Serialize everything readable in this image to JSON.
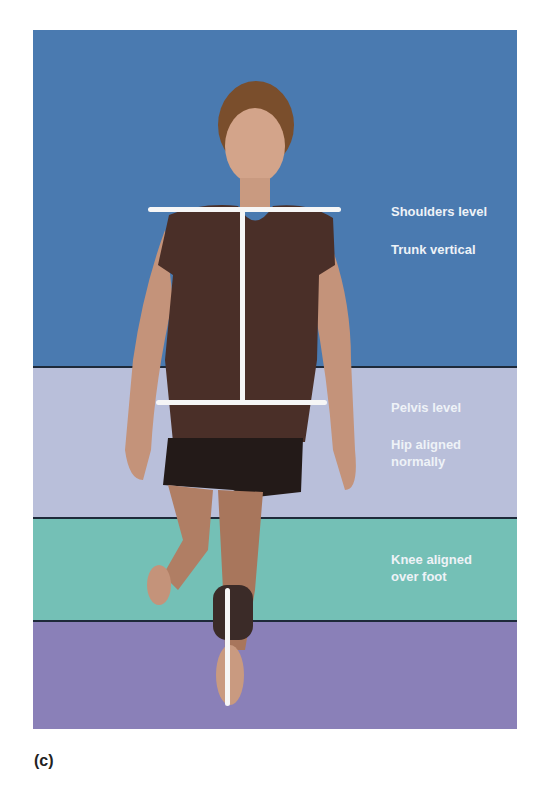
{
  "figure": {
    "bands": [
      {
        "name": "upper",
        "color": "#4a7ab0"
      },
      {
        "name": "pelvis",
        "color": "#b9bfda"
      },
      {
        "name": "knee",
        "color": "#74c0b6"
      },
      {
        "name": "foot",
        "color": "#8a80b8"
      }
    ],
    "labels": {
      "shoulders": "Shoulders level",
      "trunk": "Trunk vertical",
      "pelvis": "Pelvis level",
      "hip_line1": "Hip aligned",
      "hip_line2": "normally",
      "knee_line1": "Knee aligned",
      "knee_line2": "over foot"
    },
    "colors": {
      "shirt": "#4a2f28",
      "shorts": "#231a18",
      "skin": "#c4937a",
      "hair": "#7a4e2c",
      "guide_line": "#f6f6f6"
    }
  },
  "caption": "(c)"
}
